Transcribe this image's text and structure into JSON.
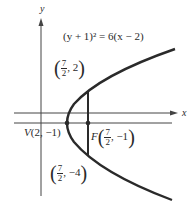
{
  "equation": "(y + 1)² = 6(x − 2)",
  "axes": {
    "x_label": "x",
    "y_label": "y"
  },
  "points": {
    "vertex": {
      "prefix": "V",
      "label": "(2, −1)"
    },
    "focus": {
      "prefix": "F",
      "num": "7",
      "den": "2",
      "y": "−1"
    },
    "upper": {
      "num": "7",
      "den": "2",
      "y": "2"
    },
    "lower": {
      "num": "7",
      "den": "2",
      "y": "−4"
    }
  },
  "colors": {
    "ink": "#2a2a2a",
    "background": "#ffffff"
  }
}
